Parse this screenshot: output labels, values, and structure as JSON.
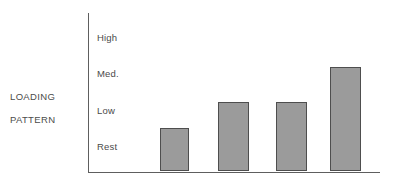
{
  "chart_data": {
    "type": "bar",
    "title": "",
    "subtitle": "",
    "xlabel": "",
    "ylabel": "LOADING\nPATTERN",
    "ylabel_lines": [
      "LOADING",
      "PATTERN"
    ],
    "categories": [
      "1",
      "2",
      "3",
      "4"
    ],
    "values": [
      1.25,
      2.0,
      2.0,
      3.0
    ],
    "value_labels": [
      "Rest+",
      "Low",
      "Low",
      "Med."
    ],
    "ytick_labels": [
      "Rest",
      "Low",
      "Med.",
      "High"
    ],
    "ytick_values": [
      1,
      2,
      3,
      4
    ],
    "ylim": [
      0,
      4.55
    ],
    "grid": false,
    "legend": false,
    "legend_position": "none",
    "series": [
      {
        "name": "Loading pattern",
        "values": [
          1.25,
          2.0,
          2.0,
          3.0
        ]
      }
    ],
    "bar_color": "#9b9b9b",
    "bar_border_color": "#4e4e4e",
    "axis_color": "#5e5e5e",
    "text_color": "#4a4a4a",
    "background": "#ffffff"
  },
  "axis": {
    "y_title_line1": "LOADING",
    "y_title_line2": "PATTERN",
    "ticks": [
      {
        "label": "High",
        "value": 4
      },
      {
        "label": "Med.",
        "value": 3
      },
      {
        "label": "Low",
        "value": 2
      },
      {
        "label": "Rest",
        "value": 1
      }
    ]
  }
}
